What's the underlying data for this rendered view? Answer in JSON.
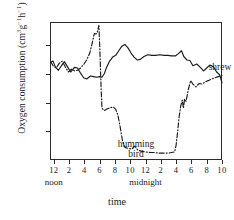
{
  "chart_data": {
    "type": "line",
    "title": "",
    "xlabel": "time",
    "ylabel": "Oxygen consumption (cm3g-1h-1)",
    "ylabel_parts": {
      "main": "Oxygen consumption (cm",
      "sup1": "3",
      "mid": "g",
      "sup2": "−1",
      "mid2": "h",
      "sup3": "−1",
      "close": ")"
    },
    "ylim": [
      0,
      24
    ],
    "yticks": [
      5,
      10,
      15,
      20
    ],
    "ytick_labels": [
      "5",
      "10",
      "15",
      "20"
    ],
    "xlim": [
      11.5,
      34
    ],
    "xticks": [
      12,
      14,
      16,
      18,
      20,
      22,
      24,
      26,
      28,
      30,
      32,
      34
    ],
    "xtick_labels": [
      "12",
      "2",
      "4",
      "6",
      "8",
      "10",
      "12",
      "2",
      "4",
      "6",
      "8",
      "10"
    ],
    "xtick_sublabels": [
      {
        "at": 12,
        "text": "noon"
      },
      {
        "at": 24,
        "text": "midnight"
      }
    ],
    "grid": false,
    "legend_position": "inline-annotations",
    "annotations": [
      {
        "name": "shrew",
        "text": "shrew",
        "x": 27.0,
        "y": 20.6
      },
      {
        "name": "humming-bird",
        "text": "humming bird",
        "line1": "humming",
        "line2": "bird",
        "x": 16.2,
        "y": 6.4
      }
    ],
    "series": [
      {
        "name": "shrew",
        "style": "solid",
        "color": "#1a1a1a",
        "points": [
          [
            11.6,
            17.0
          ],
          [
            11.9,
            17.2
          ],
          [
            12.2,
            16.2
          ],
          [
            12.6,
            15.6
          ],
          [
            13.0,
            16.4
          ],
          [
            13.4,
            17.1
          ],
          [
            13.8,
            16.2
          ],
          [
            14.2,
            15.3
          ],
          [
            14.7,
            16.1
          ],
          [
            15.1,
            16.0
          ],
          [
            15.5,
            15.1
          ],
          [
            15.9,
            14.3
          ],
          [
            16.3,
            14.1
          ],
          [
            16.8,
            14.6
          ],
          [
            17.2,
            14.5
          ],
          [
            17.6,
            14.4
          ],
          [
            18.0,
            14.5
          ],
          [
            18.3,
            14.4
          ],
          [
            18.6,
            15.0
          ],
          [
            18.9,
            16.1
          ],
          [
            19.3,
            17.2
          ],
          [
            19.7,
            17.9
          ],
          [
            20.1,
            18.2
          ],
          [
            20.5,
            19.0
          ],
          [
            20.9,
            19.8
          ],
          [
            21.3,
            20.1
          ],
          [
            21.7,
            19.5
          ],
          [
            22.1,
            18.6
          ],
          [
            22.5,
            17.9
          ],
          [
            22.9,
            17.4
          ],
          [
            23.3,
            17.5
          ],
          [
            23.8,
            18.0
          ],
          [
            24.3,
            18.3
          ],
          [
            24.8,
            18.2
          ],
          [
            25.3,
            18.2
          ],
          [
            25.9,
            18.3
          ],
          [
            26.4,
            18.2
          ],
          [
            26.9,
            18.2
          ],
          [
            27.4,
            18.1
          ],
          [
            27.9,
            18.1
          ],
          [
            28.3,
            18.5
          ],
          [
            28.7,
            19.0
          ],
          [
            29.0,
            18.0
          ],
          [
            29.4,
            17.4
          ],
          [
            29.8,
            17.3
          ],
          [
            30.2,
            16.4
          ],
          [
            30.7,
            16.7
          ],
          [
            31.1,
            16.2
          ],
          [
            31.6,
            15.5
          ],
          [
            32.0,
            16.0
          ],
          [
            32.4,
            16.5
          ],
          [
            32.9,
            16.2
          ],
          [
            33.3,
            15.3
          ],
          [
            33.7,
            14.8
          ],
          [
            34.0,
            13.4
          ]
        ]
      },
      {
        "name": "humming bird",
        "style": "dashdot",
        "color": "#1a1a1a",
        "points": [
          [
            11.6,
            17.1
          ],
          [
            11.9,
            16.4
          ],
          [
            12.3,
            16.0
          ],
          [
            12.7,
            16.8
          ],
          [
            13.1,
            17.2
          ],
          [
            13.5,
            16.2
          ],
          [
            13.9,
            15.3
          ],
          [
            14.3,
            15.8
          ],
          [
            14.7,
            15.5
          ],
          [
            15.1,
            15.6
          ],
          [
            15.5,
            16.0
          ],
          [
            15.9,
            16.6
          ],
          [
            16.3,
            17.4
          ],
          [
            16.7,
            18.6
          ],
          [
            17.0,
            20.2
          ],
          [
            17.3,
            22.0
          ],
          [
            17.5,
            21.9
          ],
          [
            17.7,
            22.3
          ],
          [
            17.9,
            23.4
          ],
          [
            18.0,
            20.0
          ],
          [
            18.1,
            16.0
          ],
          [
            18.2,
            12.0
          ],
          [
            18.3,
            9.0
          ],
          [
            18.6,
            8.6
          ],
          [
            19.0,
            8.9
          ],
          [
            19.4,
            9.1
          ],
          [
            19.8,
            9.2
          ],
          [
            20.1,
            8.8
          ],
          [
            20.4,
            7.7
          ],
          [
            20.7,
            5.6
          ],
          [
            21.0,
            3.2
          ],
          [
            21.3,
            2.2
          ],
          [
            21.8,
            2.0
          ],
          [
            22.2,
            1.9
          ],
          [
            22.6,
            2.4
          ],
          [
            23.0,
            1.7
          ],
          [
            23.5,
            1.5
          ],
          [
            24.0,
            1.4
          ],
          [
            24.6,
            1.3
          ],
          [
            25.2,
            1.3
          ],
          [
            25.8,
            1.2
          ],
          [
            26.4,
            1.2
          ],
          [
            27.0,
            1.2
          ],
          [
            27.4,
            1.3
          ],
          [
            27.8,
            1.4
          ],
          [
            28.0,
            2.6
          ],
          [
            28.2,
            5.0
          ],
          [
            28.4,
            7.6
          ],
          [
            28.6,
            9.4
          ],
          [
            28.8,
            10.4
          ],
          [
            28.95,
            9.0
          ],
          [
            29.1,
            10.6
          ],
          [
            29.3,
            10.2
          ],
          [
            29.6,
            12.3
          ],
          [
            29.9,
            13.8
          ],
          [
            30.2,
            13.2
          ],
          [
            30.6,
            12.7
          ],
          [
            31.0,
            13.3
          ],
          [
            31.4,
            13.2
          ],
          [
            31.8,
            13.6
          ],
          [
            32.2,
            13.8
          ],
          [
            32.7,
            14.1
          ],
          [
            33.1,
            14.3
          ],
          [
            33.5,
            14.5
          ],
          [
            34.0,
            14.7
          ]
        ]
      }
    ]
  }
}
